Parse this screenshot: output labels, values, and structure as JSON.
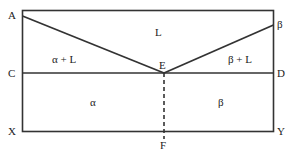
{
  "diagram": {
    "type": "eutectic phase diagram",
    "point_labels": {
      "A": "A",
      "B": "β",
      "C": "C",
      "D": "D",
      "E": "E",
      "F": "F",
      "X": "X",
      "Y": "Y"
    },
    "region_labels": {
      "liquid": "L",
      "alpha_liquid": "α + L",
      "beta_liquid": "β + L",
      "alpha": "α",
      "beta": "β"
    },
    "colors": {
      "line": "#333333",
      "text": "#222222",
      "background": "#ffffff"
    }
  }
}
